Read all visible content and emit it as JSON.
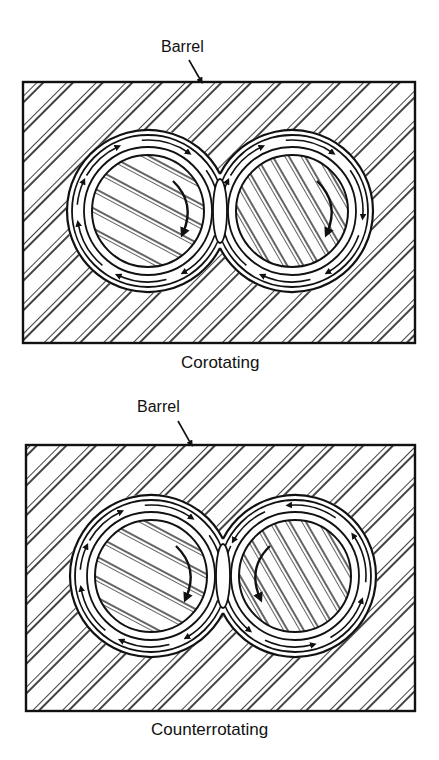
{
  "figure": {
    "panels": [
      {
        "id": "corotating",
        "barrel_label": "Barrel",
        "caption": "Corotating",
        "box": {
          "x": 23,
          "y": 82,
          "w": 392,
          "h": 261
        },
        "barrel_label_pos": {
          "x": 161,
          "y": 38
        },
        "barrel_arrow": {
          "x1": 189,
          "y1": 60,
          "x2": 201,
          "y2": 81
        },
        "caption_pos": {
          "x": 181,
          "y": 353
        },
        "screws": [
          {
            "cx": 148,
            "cy": 211,
            "direction": "clockwise"
          },
          {
            "cx": 292,
            "cy": 211,
            "direction": "clockwise"
          }
        ]
      },
      {
        "id": "counterrotating",
        "barrel_label": "Barrel",
        "caption": "Counterrotating",
        "box": {
          "x": 26,
          "y": 445,
          "w": 389,
          "h": 266
        },
        "barrel_label_pos": {
          "x": 137,
          "y": 398
        },
        "barrel_arrow": {
          "x1": 178,
          "y1": 421,
          "x2": 191,
          "y2": 444
        },
        "caption_pos": {
          "x": 151,
          "y": 720
        },
        "screws": [
          {
            "cx": 151,
            "cy": 576,
            "direction": "clockwise"
          },
          {
            "cx": 295,
            "cy": 576,
            "direction": "counterclockwise"
          }
        ]
      }
    ],
    "colors": {
      "ink": "#111111",
      "paper": "#ffffff"
    }
  }
}
